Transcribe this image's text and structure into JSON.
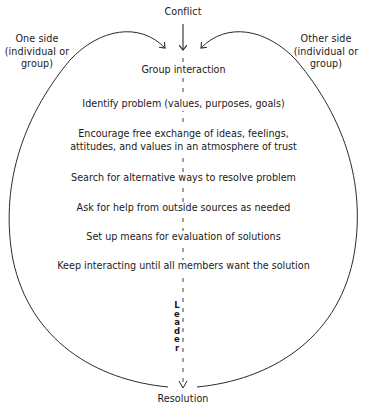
{
  "diagram": {
    "top_label": "Conflict",
    "bottom_label": "Resolution",
    "left_party": {
      "lines": [
        "One side",
        "(individual or",
        "group)"
      ]
    },
    "right_party": {
      "lines": [
        "Other side",
        "(individual or",
        "group)"
      ]
    },
    "center_title": "Group interaction",
    "steps": [
      {
        "lines": [
          "Identify problem (values, purposes, goals)"
        ]
      },
      {
        "lines": [
          "Encourage free exchange of ideas, feelings,",
          "attitudes, and values in an atmosphere of trust"
        ]
      },
      {
        "lines": [
          "Search for alternative ways to resolve problem"
        ]
      },
      {
        "lines": [
          "Ask for help from outside sources as needed"
        ]
      },
      {
        "lines": [
          "Set up means for evaluation of solutions"
        ]
      },
      {
        "lines": [
          "Keep interacting until all members want the solution"
        ]
      }
    ],
    "vertical_label": [
      "L",
      "e",
      "a",
      "d",
      "e",
      "r"
    ],
    "colors": {
      "line": "#2a2a2a",
      "text": "#1a1a1a",
      "background": "#ffffff"
    }
  }
}
